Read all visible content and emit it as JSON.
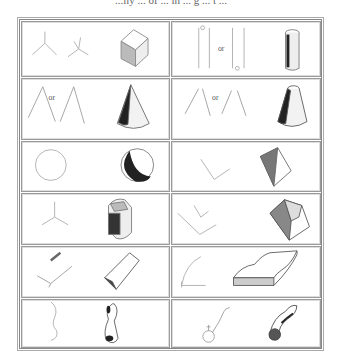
{
  "page": {
    "caption": "...ily ... of ... lh ... g ... t ..."
  },
  "grid": {
    "columns": 2,
    "rows": 6,
    "connector_word": "or",
    "panels": [
      {
        "row": 1,
        "col": 1,
        "name": "y-joints-to-cube",
        "sketch": "Y-shaped and arrow-shaped corner lines",
        "result": "shaded cube"
      },
      {
        "row": 1,
        "col": 2,
        "name": "parallel-lines-to-cylinder",
        "sketch": "pair of parallel vertical lines",
        "label": "or",
        "result": "shaded upright cylinder"
      },
      {
        "row": 2,
        "col": 1,
        "name": "converging-lines-to-cone",
        "sketch": "two lines meeting at apex",
        "label": "or",
        "result": "shaded cone"
      },
      {
        "row": 2,
        "col": 2,
        "name": "converging-lines-to-frustum",
        "sketch": "two converging lines not meeting",
        "label": "or",
        "result": "shaded truncated cone"
      },
      {
        "row": 3,
        "col": 1,
        "name": "circle-to-sphere",
        "sketch": "circle",
        "result": "shaded sphere"
      },
      {
        "row": 3,
        "col": 2,
        "name": "v-lines-to-wedge",
        "sketch": "V-shaped lines",
        "result": "shaded wedge / tetrahedron"
      },
      {
        "row": 4,
        "col": 1,
        "name": "y-joint-to-block",
        "sketch": "Y-junction",
        "result": "shaded rounded block"
      },
      {
        "row": 4,
        "col": 2,
        "name": "nested-v-to-frustum-pyramid",
        "sketch": "nested V lines",
        "result": "shaded truncated pyramid"
      },
      {
        "row": 5,
        "col": 1,
        "name": "corner-lines-to-slab",
        "sketch": "L-shaped corner with short bar",
        "result": "shaded slab"
      },
      {
        "row": 5,
        "col": 2,
        "name": "curve-to-curved-slab",
        "sketch": "corner with curved line",
        "result": "shaded curved slab"
      },
      {
        "row": 6,
        "col": 1,
        "name": "s-curve-to-peanut",
        "sketch": "S-shaped curve",
        "result": "shaded peanut / figure-8 form"
      },
      {
        "row": 6,
        "col": 2,
        "name": "curve-circle-to-gourd",
        "sketch": "small circle with curved tail",
        "result": "shaded gourd-like form"
      }
    ]
  },
  "colors": {
    "border": "#888888",
    "stroke": "#999999",
    "shade": "#333333",
    "background": "#ffffff"
  }
}
